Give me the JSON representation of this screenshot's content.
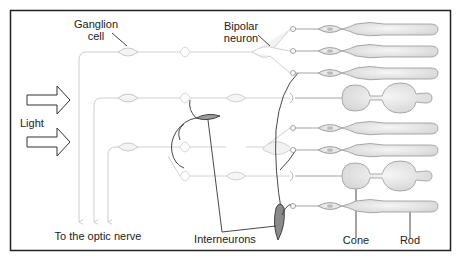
{
  "labels": {
    "ganglion": "Ganglion\ncell",
    "ganglion_line1": "Ganglion",
    "ganglion_line2": "cell",
    "bipolar_line1": "Bipolar",
    "bipolar_line2": "neuron",
    "light": "Light",
    "optic_nerve": "To the optic nerve",
    "interneurons": "Interneurons",
    "cone": "Cone",
    "rod": "Rod"
  },
  "colors": {
    "border": "#222222",
    "faint_neuron": "#cfcfcf",
    "photoreceptor_fill": "#ececec",
    "photoreceptor_stroke": "#9a9a9a",
    "dark_line": "#333333",
    "text": "#222222"
  },
  "photoreceptors": [
    {
      "type": "rod",
      "y": 29
    },
    {
      "type": "rod",
      "y": 51
    },
    {
      "type": "rod",
      "y": 73
    },
    {
      "type": "cone",
      "y": 98
    },
    {
      "type": "rod",
      "y": 128
    },
    {
      "type": "rod",
      "y": 150
    },
    {
      "type": "cone",
      "y": 174
    },
    {
      "type": "rod",
      "y": 206
    }
  ]
}
